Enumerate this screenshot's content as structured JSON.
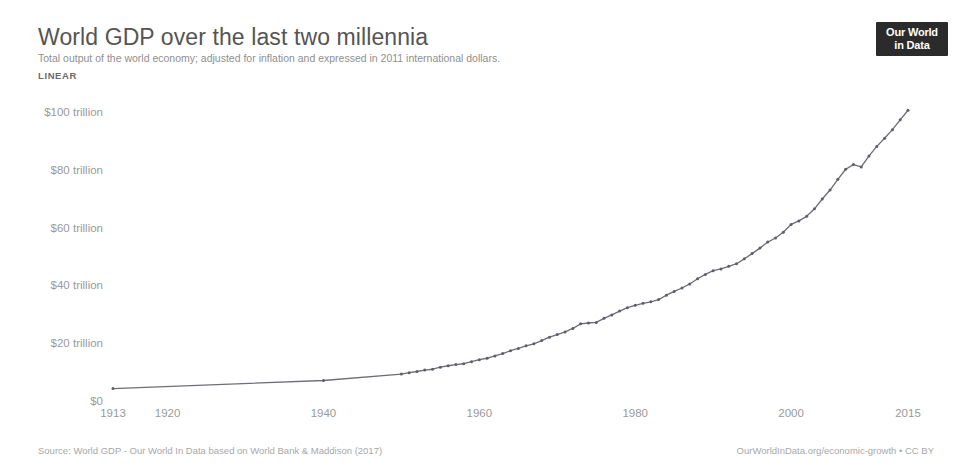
{
  "header": {
    "title": "World GDP over the last two millennia",
    "subtitle": "Total output of the world economy; adjusted for inflation and expressed in 2011 international dollars.",
    "scale_tab": "LINEAR"
  },
  "logo": {
    "line1": "Our World",
    "line2": "in Data"
  },
  "footer": {
    "source": "Source: World GDP - Our World In Data based on World Bank & Maddison (2017)",
    "link": "OurWorldInData.org/economic-growth • CC BY"
  },
  "colors": {
    "line": "#6e6e78",
    "point": "#5e5e68",
    "title": "#555555",
    "subtitle": "#8f8f8f",
    "tick": "#9a9a9a",
    "axis": "#d5d5d5",
    "logo_bg": "#2b2b2b"
  },
  "chart_data": {
    "type": "line",
    "title": "World GDP over the last two millennia",
    "subtitle": "Total output of the world economy; adjusted for inflation and expressed in 2011 international dollars.",
    "xlabel": "",
    "ylabel": "",
    "scale": "LINEAR",
    "grid": false,
    "legend": "none",
    "xlim": [
      1913,
      2015
    ],
    "ylim": [
      0,
      110
    ],
    "y_unit": "trillion 2011 international dollars",
    "y_ticks": [
      0,
      20,
      40,
      60,
      80,
      100
    ],
    "y_tick_labels": [
      "$0",
      "$20 trillion",
      "$40 trillion",
      "$60 trillion",
      "$80 trillion",
      "$100 trillion"
    ],
    "x_ticks": [
      1913,
      1920,
      1940,
      1960,
      1980,
      2000,
      2015
    ],
    "x_tick_labels": [
      "1913",
      "1920",
      "1940",
      "1960",
      "1980",
      "2000",
      "2015"
    ],
    "series": [
      {
        "name": "World GDP",
        "x": [
          1913,
          1940,
          1950,
          1951,
          1952,
          1953,
          1954,
          1955,
          1956,
          1957,
          1958,
          1959,
          1960,
          1961,
          1962,
          1963,
          1964,
          1965,
          1966,
          1967,
          1968,
          1969,
          1970,
          1971,
          1972,
          1973,
          1974,
          1975,
          1976,
          1977,
          1978,
          1979,
          1980,
          1981,
          1982,
          1983,
          1984,
          1985,
          1986,
          1987,
          1988,
          1989,
          1990,
          1991,
          1992,
          1993,
          1994,
          1995,
          1996,
          1997,
          1998,
          1999,
          2000,
          2001,
          2002,
          2003,
          2004,
          2005,
          2006,
          2007,
          2008,
          2009,
          2010,
          2011,
          2012,
          2013,
          2014,
          2015
        ],
        "y": [
          4.3,
          7.1,
          9.3,
          9.8,
          10.2,
          10.7,
          11.0,
          11.7,
          12.2,
          12.6,
          12.9,
          13.6,
          14.3,
          14.8,
          15.6,
          16.4,
          17.4,
          18.2,
          19.1,
          19.8,
          20.9,
          22.1,
          23.0,
          23.9,
          25.1,
          26.7,
          27.0,
          27.2,
          28.6,
          29.8,
          31.1,
          32.3,
          33.1,
          33.8,
          34.3,
          35.1,
          36.6,
          37.9,
          39.1,
          40.5,
          42.3,
          43.8,
          45.1,
          45.7,
          46.6,
          47.5,
          49.2,
          51.0,
          52.9,
          55.0,
          56.4,
          58.4,
          61.1,
          62.3,
          63.9,
          66.5,
          69.9,
          73.0,
          76.7,
          80.2,
          81.8,
          81.0,
          84.8,
          88.1,
          90.9,
          93.9,
          97.3,
          100.6
        ]
      }
    ]
  }
}
